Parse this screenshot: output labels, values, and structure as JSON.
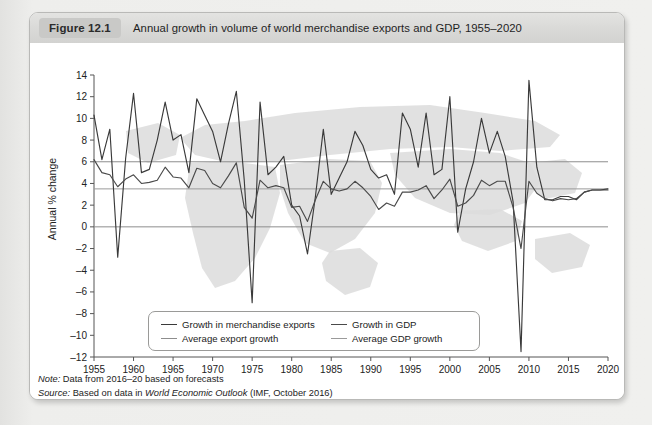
{
  "figure": {
    "badge": "Figure 12.1",
    "title": "Annual growth in volume of world merchandise exports and GDP, 1955–2020"
  },
  "notes": {
    "note_label": "Note:",
    "note_text": " Data from 2016–20 based on forecasts",
    "source_label": "Source:",
    "source_text_pre": " Based on data in ",
    "source_italic": "World Economic Outlook",
    "source_text_post": " (IMF, October 2016)"
  },
  "legend": [
    {
      "label": "Growth in merchandise exports",
      "color": "#3a3a3a"
    },
    {
      "label": "Growth in GDP",
      "color": "#4a4a4a"
    },
    {
      "label": "Average export growth",
      "color": "#8d8d8d"
    },
    {
      "label": "Average GDP growth",
      "color": "#9a9a9a"
    }
  ],
  "colors": {
    "exports_line": "#3a3a3a",
    "gdp_line": "#4a4a4a",
    "avg_export_line": "#8d8d8d",
    "avg_gdp_line": "#9a9a9a",
    "zero_line": "#8d8d8d",
    "axis": "#555555",
    "map_silhouette": "#dcdcdc",
    "card_background": "#ffffff",
    "title_bar": "#d9d9d7",
    "badge": "#c9c9c7"
  },
  "chart_data": {
    "type": "line",
    "title": "Annual growth in volume of world merchandise exports and GDP, 1955–2020",
    "xlabel": "",
    "ylabel": "Annual % change",
    "ylim": [
      -12,
      14
    ],
    "xlim": [
      1955,
      2020
    ],
    "ytick_step": 2,
    "yticks": [
      -12,
      -10,
      -8,
      -6,
      -4,
      -2,
      0,
      2,
      4,
      6,
      8,
      10,
      12,
      14
    ],
    "xticks": [
      1955,
      1960,
      1965,
      1970,
      1975,
      1980,
      1985,
      1990,
      1995,
      2000,
      2005,
      2010,
      2015,
      2020
    ],
    "grid": false,
    "legend_position": "inside-bottom",
    "reference_lines": [
      {
        "name": "Average export growth",
        "value": 6.0,
        "color": "#8d8d8d"
      },
      {
        "name": "Average GDP growth",
        "value": 3.5,
        "color": "#9a9a9a"
      },
      {
        "name": "Zero",
        "value": 0,
        "color": "#8d8d8d"
      }
    ],
    "x": [
      1955,
      1956,
      1957,
      1958,
      1959,
      1960,
      1961,
      1962,
      1963,
      1964,
      1965,
      1966,
      1967,
      1968,
      1969,
      1970,
      1971,
      1972,
      1973,
      1974,
      1975,
      1976,
      1977,
      1978,
      1979,
      1980,
      1981,
      1982,
      1983,
      1984,
      1985,
      1986,
      1987,
      1988,
      1989,
      1990,
      1991,
      1992,
      1993,
      1994,
      1995,
      1996,
      1997,
      1998,
      1999,
      2000,
      2001,
      2002,
      2003,
      2004,
      2005,
      2006,
      2007,
      2008,
      2009,
      2010,
      2011,
      2012,
      2013,
      2014,
      2015,
      2016,
      2017,
      2018,
      2019,
      2020
    ],
    "series": [
      {
        "name": "Growth in merchandise exports",
        "color": "#3a3a3a",
        "values": [
          10.3,
          6.2,
          9.0,
          -2.8,
          6.3,
          12.3,
          5.0,
          5.3,
          8.0,
          11.5,
          8.0,
          8.5,
          5.0,
          11.8,
          10.3,
          8.8,
          6.0,
          9.5,
          12.5,
          4.3,
          -7.0,
          11.5,
          4.8,
          5.5,
          6.5,
          2.0,
          1.0,
          -2.5,
          2.8,
          9.0,
          3.0,
          4.5,
          6.0,
          8.8,
          7.5,
          5.3,
          4.5,
          4.8,
          3.0,
          10.5,
          9.0,
          5.5,
          10.5,
          4.8,
          5.3,
          12.0,
          -0.5,
          3.5,
          6.0,
          10.0,
          6.8,
          8.8,
          6.5,
          2.3,
          -11.5,
          13.5,
          5.5,
          2.5,
          2.5,
          2.8,
          2.8,
          2.5,
          3.2,
          3.4,
          3.4,
          3.5
        ]
      },
      {
        "name": "Growth in GDP",
        "color": "#4a4a4a",
        "values": [
          6.2,
          5.0,
          4.8,
          3.7,
          4.4,
          4.8,
          4.0,
          4.1,
          4.3,
          5.5,
          4.6,
          4.5,
          3.6,
          5.4,
          5.2,
          4.0,
          3.6,
          4.7,
          5.9,
          1.8,
          0.8,
          4.3,
          3.6,
          3.8,
          3.6,
          1.8,
          1.9,
          0.5,
          2.5,
          4.2,
          3.5,
          3.3,
          3.5,
          4.2,
          3.6,
          2.8,
          1.6,
          2.2,
          1.9,
          3.2,
          3.2,
          3.4,
          3.8,
          2.6,
          3.4,
          4.4,
          1.9,
          2.2,
          2.9,
          4.3,
          3.8,
          4.2,
          4.2,
          1.8,
          -2.0,
          4.2,
          3.1,
          2.6,
          2.4,
          2.6,
          2.5,
          2.6,
          3.2,
          3.4,
          3.4,
          3.4
        ]
      }
    ]
  }
}
